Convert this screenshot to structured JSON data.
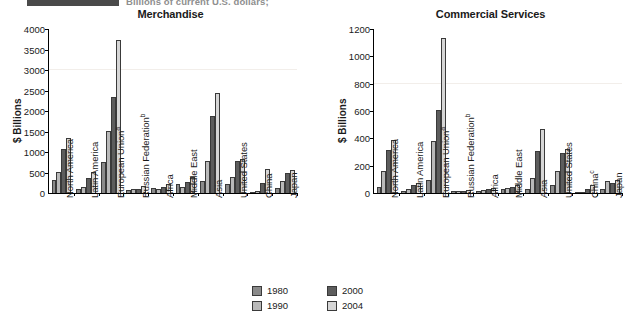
{
  "header": {
    "subtitle": "Billions of current U.S. dollars;",
    "ghost_text": "",
    "rule_color": "#4a4a4a"
  },
  "legend": {
    "position": "bottom-center",
    "items": [
      {
        "label": "1980",
        "color": "#8a8a8a",
        "key": "s1980"
      },
      {
        "label": "2000",
        "color": "#5d5d5d",
        "key": "s2000"
      },
      {
        "label": "1990",
        "color": "#b9b9b9",
        "key": "s1990"
      },
      {
        "label": "2004",
        "color": "#d6d6d6",
        "key": "s2004"
      }
    ]
  },
  "chart_data": [
    {
      "type": "bar",
      "title": "Merchandise",
      "xlabel": "",
      "ylabel": "$ Billions",
      "ylim": [
        0,
        4000
      ],
      "yticks": [
        0,
        500,
        1000,
        1500,
        2000,
        2500,
        3000,
        3500,
        4000
      ],
      "grid": true,
      "categories": [
        "North America",
        "Latin America",
        "European Union",
        "Russian Federation",
        "Africa",
        "Middle East",
        "Asia",
        "United States",
        "China",
        "Japan"
      ],
      "category_footnotes": [
        "",
        "",
        "a",
        "b",
        "",
        "",
        "",
        "",
        "",
        ""
      ],
      "series": [
        {
          "name": "1980",
          "values": [
            310,
            110,
            760,
            80,
            120,
            210,
            300,
            225,
            20,
            130
          ]
        },
        {
          "name": "1990",
          "values": [
            520,
            140,
            1520,
            100,
            105,
            140,
            780,
            390,
            60,
            290
          ]
        },
        {
          "name": "2000",
          "values": [
            1070,
            360,
            2340,
            105,
            150,
            270,
            1890,
            780,
            250,
            480
          ]
        },
        {
          "name": "2004",
          "values": [
            1330,
            520,
            3740,
            180,
            230,
            390,
            2430,
            820,
            590,
            570
          ]
        }
      ]
    },
    {
      "type": "bar",
      "title": "Commercial Services",
      "xlabel": "",
      "ylabel": "$ Billions",
      "ylim": [
        0,
        1200
      ],
      "yticks": [
        0,
        200,
        400,
        600,
        800,
        1000,
        1200
      ],
      "grid": true,
      "categories": [
        "North America",
        "Latin America",
        "European Union",
        "Russian Federation",
        "Africa",
        "Middle East",
        "Asia",
        "United States",
        "China",
        "Japan"
      ],
      "category_footnotes": [
        "",
        "",
        "a",
        "b",
        "",
        "",
        "",
        "",
        "c",
        ""
      ],
      "series": [
        {
          "name": "1980",
          "values": [
            45,
            17,
            95,
            12,
            18,
            32,
            30,
            60,
            5,
            30
          ]
        },
        {
          "name": "1990",
          "values": [
            160,
            26,
            380,
            18,
            22,
            40,
            110,
            160,
            10,
            85
          ]
        },
        {
          "name": "2000",
          "values": [
            315,
            60,
            610,
            14,
            30,
            45,
            310,
            290,
            30,
            70
          ]
        },
        {
          "name": "2004",
          "values": [
            385,
            70,
            1135,
            25,
            40,
            60,
            465,
            320,
            60,
            95
          ]
        }
      ]
    }
  ]
}
